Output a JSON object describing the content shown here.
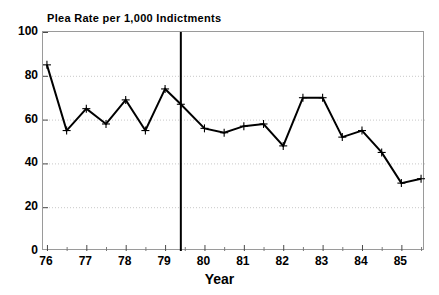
{
  "chart_data": {
    "type": "line",
    "title": "Plea Rate per 1,000 Indictments",
    "xlabel": "Year",
    "ylabel": "",
    "xlim": [
      75.9,
      85.6
    ],
    "ylim": [
      0,
      100
    ],
    "grid": true,
    "legend": null,
    "marker": "plus",
    "line_color": "#000000",
    "grid_color": "#c8c8c8",
    "frame_color": "#9a9a9a",
    "background": "#ffffff",
    "y_ticks": [
      0,
      20,
      40,
      60,
      80,
      100
    ],
    "y_tick_labels": [
      "0",
      "20",
      "40",
      "60",
      "80",
      "100"
    ],
    "x_ticks": [
      76,
      77,
      78,
      79,
      80,
      81,
      82,
      83,
      84,
      85
    ],
    "x_tick_labels": [
      "76",
      "77",
      "78",
      "79",
      "80",
      "81",
      "82",
      "83",
      "84",
      "85"
    ],
    "x_minor_ticks": [
      76.5,
      77.5,
      78.5,
      79.5,
      80.5,
      81.5,
      82.5,
      83.5,
      84.5,
      85.5
    ],
    "x": [
      76.0,
      76.5,
      77.0,
      77.5,
      78.0,
      78.5,
      79.0,
      79.4,
      80.0,
      80.5,
      81.0,
      81.5,
      82.0,
      82.5,
      83.0,
      83.5,
      84.0,
      84.5,
      85.0,
      85.5
    ],
    "values": [
      85,
      55,
      65,
      58,
      69,
      55,
      74,
      67,
      56,
      54,
      57,
      58,
      48,
      70,
      70,
      52,
      55,
      45,
      31,
      33
    ],
    "annotations": [
      {
        "name": "vertical-reference-line",
        "type": "vline",
        "x": 79.4,
        "color": "#000000",
        "width": 2
      }
    ]
  }
}
